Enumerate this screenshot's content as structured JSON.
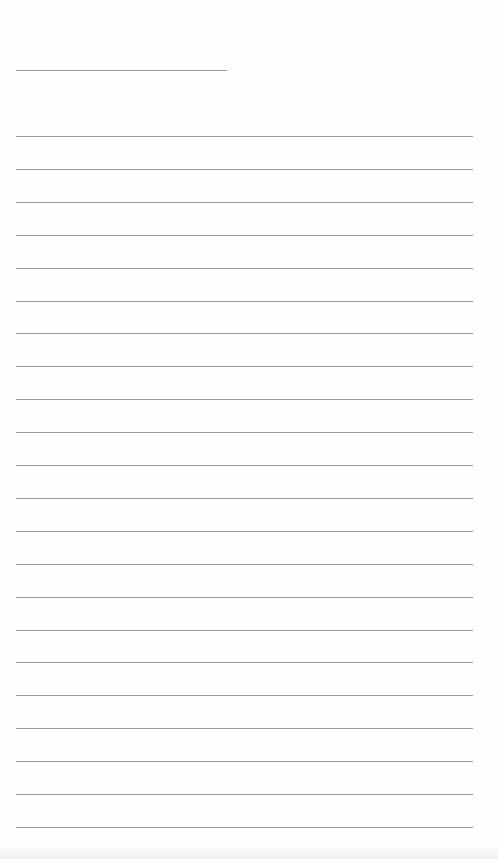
{
  "document": {
    "type": "blank lined paper",
    "title_line": {
      "x": 16,
      "y": 70,
      "width": 211
    },
    "body_lines": {
      "x": 16,
      "start_y": 136,
      "spacing": 32.9,
      "count": 22,
      "width": 457
    },
    "line_color": "#9a9a9a",
    "background": "#fefefe"
  }
}
